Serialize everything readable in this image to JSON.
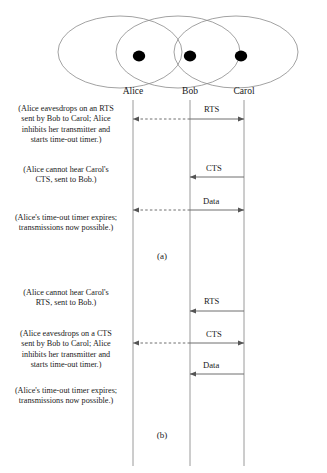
{
  "figure": {
    "caption_a": "(a)",
    "caption_b": "(b)"
  },
  "nodes": [
    {
      "id": "alice",
      "label": "Alice",
      "x": 133
    },
    {
      "id": "bob",
      "label": "Bob",
      "x": 190
    },
    {
      "id": "carol",
      "label": "Carol",
      "x": 244
    }
  ],
  "coverage_ellipses": [
    {
      "owner": "alice",
      "cx": 120,
      "cy": 52
    },
    {
      "owner": "bob",
      "cx": 178,
      "cy": 52
    },
    {
      "owner": "carol",
      "cx": 236,
      "cy": 52
    }
  ],
  "scenario_a": {
    "notes": [
      "(Alice eavesdrops on an RTS\nsent by Bob to Carol; Alice\ninhibits her transmitter and\nstarts time-out timer.)",
      "(Alice cannot hear Carol's\nCTS, sent to Bob.)",
      "(Alice's time-out timer expires;\ntransmissions now possible.)"
    ],
    "messages": [
      {
        "label": "RTS",
        "from": "bob",
        "to": "carol",
        "style": "solid"
      },
      {
        "label": "",
        "from": "bob",
        "to": "alice",
        "style": "dashed"
      },
      {
        "label": "CTS",
        "from": "carol",
        "to": "bob",
        "style": "solid"
      },
      {
        "label": "Data",
        "from": "bob",
        "to": "carol",
        "style": "solid"
      },
      {
        "label": "",
        "from": "bob",
        "to": "alice",
        "style": "dashed"
      }
    ]
  },
  "scenario_b": {
    "notes": [
      "(Alice cannot hear Carol's\nRTS, sent to Bob.)",
      "(Alice eavesdrops on a CTS\nsent by Bob to Carol; Alice\ninhibits her transmitter and\nstarts time-out timer.)",
      "(Alice's time-out timer expires;\ntransmissions now possible.)"
    ],
    "messages": [
      {
        "label": "RTS",
        "from": "carol",
        "to": "bob",
        "style": "solid"
      },
      {
        "label": "CTS",
        "from": "bob",
        "to": "carol",
        "style": "solid"
      },
      {
        "label": "",
        "from": "bob",
        "to": "alice",
        "style": "dashed"
      },
      {
        "label": "Data",
        "from": "carol",
        "to": "bob",
        "style": "solid"
      }
    ]
  },
  "colors": {
    "line": "#808080",
    "text": "#1a1a1a",
    "node_dot": "#000000",
    "ellipse_stroke": "#8a8a8a"
  },
  "labels": {
    "rts": "RTS",
    "cts": "CTS",
    "data": "Data"
  }
}
